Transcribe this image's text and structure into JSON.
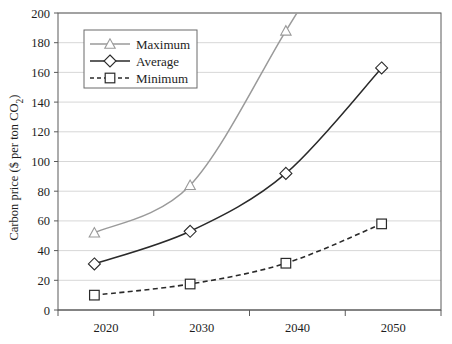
{
  "chart_data": {
    "type": "line",
    "title": "",
    "xlabel": "",
    "ylabel": "Carbon price ($ per ton CO2)",
    "ylabel_main": "Carbon price ($ per ton CO",
    "ylabel_sub": "2",
    "ylabel_close": ")",
    "categories": [
      "2020",
      "2030",
      "2040",
      "2050"
    ],
    "x_tick_labels": [
      "2020",
      "2030",
      "2040",
      "2050"
    ],
    "y_tick_labels": [
      "0",
      "20",
      "40",
      "60",
      "80",
      "100",
      "120",
      "140",
      "160",
      "180",
      "200"
    ],
    "y_tick_values": [
      0,
      20,
      40,
      60,
      80,
      100,
      120,
      140,
      160,
      180,
      200
    ],
    "ylim": [
      0,
      200
    ],
    "grid": true,
    "grid_axis": "y",
    "legend_position": "upper-left-inside",
    "series": [
      {
        "name": "Maximum",
        "values": [
          52,
          84,
          188,
          null
        ],
        "marker": "triangle",
        "line_style": "solid",
        "color": "#9a9a9a",
        "clipped_above_axis_max": true
      },
      {
        "name": "Average",
        "values": [
          31,
          53,
          92,
          163
        ],
        "marker": "diamond",
        "line_style": "solid",
        "color": "#2a2a2a"
      },
      {
        "name": "Minimum",
        "values": [
          10,
          17.5,
          31.5,
          58
        ],
        "marker": "square",
        "line_style": "dashed",
        "color": "#2a2a2a"
      }
    ]
  },
  "legend": {
    "items": [
      {
        "label": "Maximum"
      },
      {
        "label": "Average"
      },
      {
        "label": "Minimum"
      }
    ]
  },
  "colors": {
    "maximum": "#9a9a9a",
    "average": "#2a2a2a",
    "minimum": "#2a2a2a",
    "gridline": "#d2d2d2",
    "axis": "#5a5a5a",
    "background": "#ffffff"
  }
}
